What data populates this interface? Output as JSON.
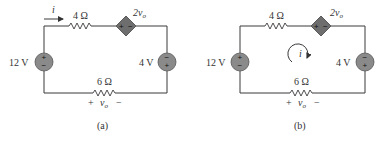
{
  "panels": [
    {
      "id": "a",
      "caption": "(a)",
      "source_left": {
        "label": "12 V",
        "top": "+",
        "bottom": "−"
      },
      "source_right": {
        "label": "4 V",
        "top": "−",
        "bottom": "+"
      },
      "resistor_top": {
        "label": "4 Ω"
      },
      "resistor_bottom": {
        "label": "6 Ω"
      },
      "dependent_source": {
        "label": "2v",
        "sub": "o",
        "left": "+",
        "right": "−"
      },
      "vo_label": {
        "plus": "+",
        "var": "v",
        "sub": "o",
        "minus": "−"
      },
      "current": {
        "label": "i",
        "type": "arrow"
      }
    },
    {
      "id": "b",
      "caption": "(b)",
      "source_left": {
        "label": "12 V",
        "top": "+",
        "bottom": "−"
      },
      "source_right": {
        "label": "4 V",
        "top": "−",
        "bottom": "+"
      },
      "resistor_top": {
        "label": "4 Ω"
      },
      "resistor_bottom": {
        "label": "6 Ω"
      },
      "dependent_source": {
        "label": "2v",
        "sub": "o",
        "left": "+",
        "right": "−"
      },
      "vo_label": {
        "plus": "+",
        "var": "v",
        "sub": "o",
        "minus": "−"
      },
      "current": {
        "label": "i",
        "type": "mesh-loop-clockwise"
      }
    }
  ]
}
